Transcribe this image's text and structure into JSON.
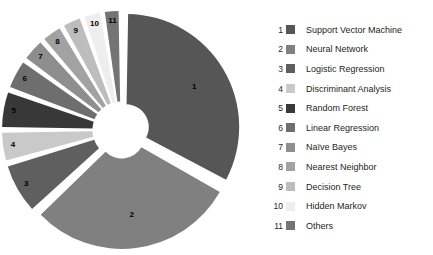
{
  "chart_data": {
    "type": "pie",
    "title": "",
    "subtitle": "",
    "xlabel": "",
    "ylabel": "",
    "variant": "exploded-donut",
    "legend_position": "right",
    "grid": false,
    "inner_radius_ratio": 0.2,
    "start_angle_deg": 0,
    "direction": "clockwise",
    "categories": [
      "Support Vector Machine",
      "Neural Network",
      "Logistic Regression",
      "Discriminant Analysis",
      "Random Forest",
      "Linear Regression",
      "Naïve Bayes",
      "Nearest Neighbor",
      "Decision Tree",
      "Hidden Markov",
      "Others"
    ],
    "values": [
      33,
      30,
      7.5,
      4.5,
      5.5,
      4.5,
      3.5,
      3.2,
      3.0,
      2.8,
      2.5
    ],
    "colors": [
      "#565656",
      "#808080",
      "#5f5f5f",
      "#c9c9c9",
      "#383838",
      "#6e6e6e",
      "#8e8e8e",
      "#a2a2a2",
      "#bdbdbd",
      "#eeeeee",
      "#747474"
    ],
    "slice_labels": [
      "1",
      "2",
      "3",
      "4",
      "5",
      "6",
      "7",
      "8",
      "9",
      "10",
      "11"
    ]
  },
  "legend": {
    "items": [
      {
        "index": "1",
        "label": "Support Vector Machine",
        "color": "#565656"
      },
      {
        "index": "2",
        "label": "Neural Network",
        "color": "#808080"
      },
      {
        "index": "3",
        "label": "Logistic Regression",
        "color": "#5f5f5f"
      },
      {
        "index": "4",
        "label": "Discriminant Analysis",
        "color": "#c9c9c9"
      },
      {
        "index": "5",
        "label": "Random Forest",
        "color": "#383838"
      },
      {
        "index": "6",
        "label": "Linear Regression",
        "color": "#6e6e6e"
      },
      {
        "index": "7",
        "label": "Naïve Bayes",
        "color": "#8e8e8e"
      },
      {
        "index": "8",
        "label": "Nearest Neighbor",
        "color": "#a2a2a2"
      },
      {
        "index": "9",
        "label": "Decision Tree",
        "color": "#bdbdbd"
      },
      {
        "index": "10",
        "label": "Hidden Markov",
        "color": "#eeeeee"
      },
      {
        "index": "11",
        "label": "Others",
        "color": "#747474"
      }
    ]
  },
  "canvas": {
    "background": "#ffffff",
    "gap_color": "#ffffff"
  }
}
